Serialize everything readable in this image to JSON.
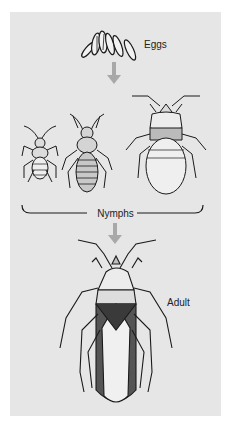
{
  "diagram": {
    "type": "life-cycle",
    "stages": [
      {
        "id": "eggs",
        "label": "Eggs"
      },
      {
        "id": "nymphs",
        "label": "Nymphs",
        "count_illustrated": 3
      },
      {
        "id": "adult",
        "label": "Adult"
      }
    ],
    "arrows": [
      {
        "from": "eggs",
        "to": "nymphs"
      },
      {
        "from": "nymphs",
        "to": "adult"
      }
    ]
  },
  "colors": {
    "panel_background": "#e6e6e6",
    "arrow": "#a8a8a8",
    "ink": "#1a1a1a",
    "text": "#222222"
  }
}
